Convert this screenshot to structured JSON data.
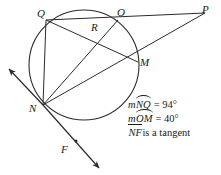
{
  "figure": {
    "stroke_color": "#2b2b2b",
    "background_color": "#ffffff",
    "circle": {
      "cx": 84,
      "cy": 65,
      "r": 55
    },
    "points": [
      {
        "name": "Q",
        "label": "Q",
        "x": 46,
        "y": 20,
        "label_x": 38,
        "label_y": 9,
        "on_circle": true
      },
      {
        "name": "O",
        "label": "O",
        "x": 118,
        "y": 20,
        "label_x": 118,
        "label_y": 8,
        "on_circle": true
      },
      {
        "name": "M",
        "label": "M",
        "x": 138,
        "y": 62,
        "label_x": 140,
        "label_y": 60,
        "on_circle": true
      },
      {
        "name": "N",
        "label": "N",
        "x": 43,
        "y": 105,
        "label_x": 30,
        "label_y": 104,
        "on_circle": true
      },
      {
        "name": "R",
        "label": "R",
        "x": 97,
        "y": 33,
        "label_x": 92,
        "label_y": 22,
        "on_circle": false
      },
      {
        "name": "P",
        "label": "P",
        "x": 205,
        "y": 13,
        "label_x": 203,
        "label_y": 5,
        "on_circle": false
      },
      {
        "name": "F",
        "label": "F",
        "x": 76,
        "y": 148,
        "label_x": 62,
        "label_y": 146,
        "on_circle": false
      }
    ],
    "segments": [
      {
        "name": "segment-Q-to-P",
        "from": "Q",
        "to": "P"
      },
      {
        "name": "segment-Q-to-M",
        "from": "Q",
        "to": "M"
      },
      {
        "name": "segment-Q-to-N",
        "from": "Q",
        "to": "N"
      },
      {
        "name": "segment-N-to-O",
        "from": "N",
        "to": "O"
      },
      {
        "name": "segment-N-to-P",
        "from": "N",
        "to": "P"
      }
    ],
    "tangent": {
      "name": "tangent-ray-through-N",
      "arrow_start_x": 8,
      "arrow_start_y": 70,
      "arrow_end_x": 100,
      "arrow_end_y": 170,
      "through_x": 43,
      "through_y": 105,
      "marked_point": "F"
    }
  },
  "statements": {
    "line1": {
      "measure_prefix": "m",
      "arc_name": "NQ",
      "equals": "=",
      "value": "94",
      "degree": "°"
    },
    "line2": {
      "measure_prefix": "m",
      "arc_name": "OM",
      "equals": "=",
      "value": "40",
      "degree": "°"
    },
    "line3": {
      "segment_name": "NF",
      "text": "is a tangent"
    }
  }
}
